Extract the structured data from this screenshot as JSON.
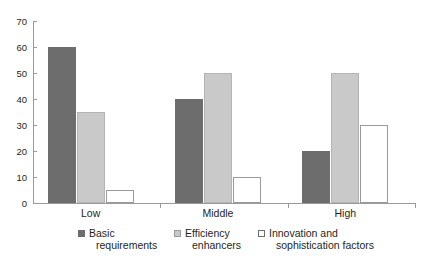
{
  "chart_data": {
    "type": "bar",
    "title": "",
    "subtitle": "",
    "xlabel": "",
    "ylabel": "",
    "categories": [
      "Low",
      "Middle",
      "High"
    ],
    "series": [
      {
        "name": "Basic requirements",
        "values": [
          60,
          40,
          20
        ],
        "color": "#6d6d6d"
      },
      {
        "name": "Efficiency enhancers",
        "values": [
          35,
          50,
          50
        ],
        "color": "#c9c9c9"
      },
      {
        "name": "Innovation and sophistication factors",
        "values": [
          5,
          10,
          30
        ],
        "color": "#ffffff"
      }
    ],
    "ylim": [
      0,
      70
    ],
    "yticks": [
      0,
      10,
      20,
      30,
      40,
      50,
      60,
      70
    ],
    "ytick_labels": [
      "0",
      "10",
      "20",
      "30",
      "40",
      "50",
      "60",
      "70"
    ],
    "grid": false,
    "legend_position": "bottom",
    "legend": [
      "Basic requirements",
      "Efficiency enhancers",
      "Innovation and sophistication factors"
    ],
    "legend_lines": [
      [
        "Basic",
        "requirements"
      ],
      [
        "Efficiency",
        "enhancers"
      ],
      [
        "Innovation and",
        "sophistication factors"
      ]
    ]
  }
}
